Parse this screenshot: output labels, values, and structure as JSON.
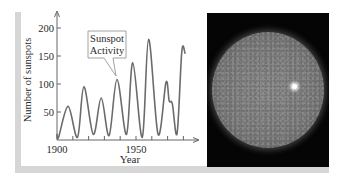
{
  "chart_data": {
    "type": "line",
    "title": "",
    "annotation": [
      "Sunspot",
      "Activity"
    ],
    "xlabel": "Year",
    "ylabel": "Number of sunspots",
    "xlim": [
      1900,
      1985
    ],
    "ylim": [
      0,
      210
    ],
    "x_ticks": [
      1900,
      1950
    ],
    "x_minor_tick_step": 10,
    "y_ticks": [
      50,
      100,
      150,
      200
    ],
    "grid": false,
    "legend": null,
    "series": [
      {
        "name": "Sunspot Activity",
        "x": [
          1900,
          1901,
          1907,
          1913,
          1917,
          1923,
          1928,
          1933,
          1938,
          1944,
          1948,
          1954,
          1958,
          1964,
          1969,
          1971,
          1973,
          1976,
          1979,
          1981
        ],
        "values": [
          10,
          5,
          60,
          5,
          95,
          10,
          75,
          8,
          108,
          10,
          138,
          5,
          180,
          10,
          103,
          70,
          65,
          12,
          158,
          155
        ]
      }
    ],
    "line_color": "#6b6b6b"
  },
  "image": {
    "caption_semantic": "photo of the sun showing surface texture and a bright spot",
    "frame_color": "#050505"
  }
}
